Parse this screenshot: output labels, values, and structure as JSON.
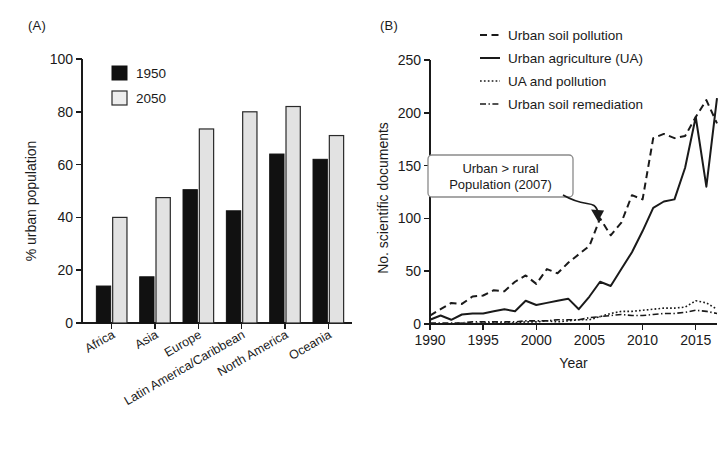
{
  "figure": {
    "panel_a_label": "(A)",
    "panel_b_label": "(B)"
  },
  "chart_data": [
    {
      "id": "panel-a",
      "type": "bar",
      "title": "",
      "panel": "(A)",
      "xlabel": "",
      "ylabel": "% urban population",
      "ylim": [
        0,
        100
      ],
      "yticks": [
        0,
        20,
        40,
        60,
        80,
        100
      ],
      "ytick_labels": [
        "0",
        "20",
        "40",
        "60",
        "80",
        "100"
      ],
      "grid": false,
      "legend_position": "top-left",
      "categories": [
        "Africa",
        "Asia",
        "Europe",
        "Latin America/Caribbean",
        "North America",
        "Oceania"
      ],
      "series": [
        {
          "name": "1950",
          "color": "#111111",
          "values": [
            14,
            17.5,
            50.5,
            42.5,
            64,
            62
          ]
        },
        {
          "name": "2050",
          "color": "#e2e2e2",
          "values": [
            40,
            47.5,
            73.5,
            80,
            82,
            71
          ]
        }
      ]
    },
    {
      "id": "panel-b",
      "type": "line",
      "title": "",
      "panel": "(B)",
      "xlabel": "Year",
      "ylabel": "No. scientific documents",
      "xlim": [
        1990,
        2017
      ],
      "ylim": [
        0,
        250
      ],
      "xticks": [
        1990,
        1995,
        2000,
        2005,
        2010,
        2015
      ],
      "xtick_labels": [
        "1990",
        "1995",
        "2000",
        "2005",
        "2010",
        "2015"
      ],
      "yticks": [
        0,
        50,
        100,
        150,
        200,
        250
      ],
      "ytick_labels": [
        "0",
        "50",
        "100",
        "150",
        "200",
        "250"
      ],
      "grid": false,
      "legend_position": "top-right",
      "x": [
        1990,
        1991,
        1992,
        1993,
        1994,
        1995,
        1996,
        1997,
        1998,
        1999,
        2000,
        2001,
        2002,
        2003,
        2004,
        2005,
        2006,
        2007,
        2008,
        2009,
        2010,
        2011,
        2012,
        2013,
        2014,
        2015,
        2016,
        2017
      ],
      "series": [
        {
          "name": "Urban soil pollution",
          "style": "dashed",
          "values": [
            8,
            14,
            20,
            19,
            26,
            27,
            32,
            31,
            40,
            46,
            38,
            52,
            48,
            58,
            66,
            74,
            100,
            84,
            96,
            122,
            118,
            176,
            180,
            176,
            178,
            196,
            212,
            190
          ]
        },
        {
          "name": "Urban agriculture (UA)",
          "style": "solid",
          "values": [
            4,
            8,
            4,
            9,
            10,
            10,
            12,
            14,
            12,
            22,
            18,
            20,
            22,
            24,
            14,
            26,
            40,
            36,
            52,
            68,
            88,
            110,
            116,
            118,
            148,
            196,
            130,
            214
          ]
        },
        {
          "name": "UA and pollution",
          "style": "dotted",
          "values": [
            0,
            0,
            0,
            1,
            0,
            1,
            1,
            1,
            1,
            2,
            2,
            3,
            2,
            3,
            4,
            4,
            7,
            10,
            12,
            12,
            13,
            14,
            15,
            15,
            16,
            22,
            20,
            14
          ]
        },
        {
          "name": "Urban soil remediation",
          "style": "dashdot",
          "values": [
            1,
            1,
            1,
            1,
            2,
            2,
            2,
            2,
            2,
            3,
            3,
            3,
            4,
            4,
            4,
            6,
            7,
            8,
            9,
            8,
            8,
            9,
            10,
            10,
            11,
            13,
            12,
            10
          ]
        }
      ],
      "annotation": {
        "line1": "Urban > rural",
        "line2": "Population (2007)",
        "points_to_year": 2006,
        "points_to_value": 100
      }
    }
  ]
}
